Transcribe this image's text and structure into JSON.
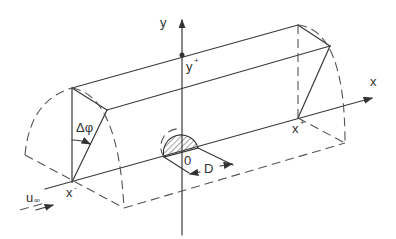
{
  "diagram": {
    "labels": {
      "y_axis": "y",
      "x_axis": "x",
      "y_plus": "y",
      "y_plus_sup": "+",
      "x_minus": "x",
      "x_minus_sup": "-",
      "x_plus": "x",
      "x_plus_sup": "+",
      "angle": "Δφ",
      "origin": "0",
      "diameter": "D",
      "freestream": "u",
      "freestream_sub": "∞"
    },
    "colors": {
      "line": "#3a3a3a",
      "background": "#ffffff"
    }
  }
}
